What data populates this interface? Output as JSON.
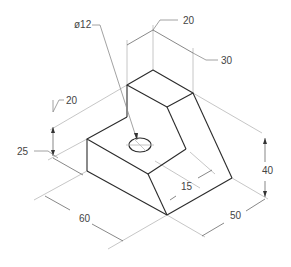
{
  "drawing": {
    "title": "Isometric view of stepped block with hole",
    "colors": {
      "object_line": "#2b2b2b",
      "extension_line": "#b8b8b8",
      "dimension_line": "#555555",
      "text": "#444444",
      "background": "#ffffff"
    },
    "dimensions": {
      "hole_diameter": "ø12",
      "upper_width": "20",
      "upper_depth": "30",
      "step_height": "20",
      "base_height": "25",
      "length": "60",
      "slot_offset": "15",
      "total_height": "40",
      "depth": "50"
    }
  }
}
